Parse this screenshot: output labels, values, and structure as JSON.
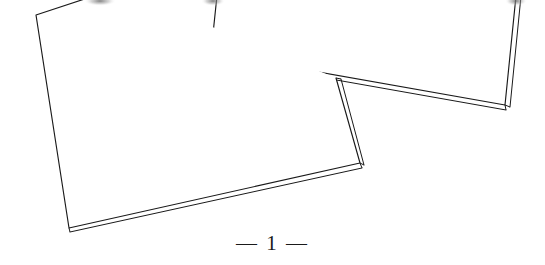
{
  "document": {
    "type": "scanned-page-photograph",
    "background_color": "#ffffff",
    "ink_color": "#1a1a1a",
    "width": 545,
    "height": 265
  },
  "folio": {
    "label": "— 1 —",
    "page_number": "1",
    "left_rule": "—",
    "right_rule": "—",
    "center_x": 303,
    "baseline_y": 248,
    "font_size_px": 21
  },
  "objects": [
    {
      "name": "left-sheet",
      "description": "large quadrilateral sheet of paper, tilted, lower-left of frame, drawn with a doubled edge showing paper thickness along the bottom and right sides",
      "stroke_color": "#1a1a1a",
      "stroke_width": 1.1,
      "fill": "#ffffff",
      "outline": [
        [
          36,
          15
        ],
        [
          118,
          -12
        ],
        [
          336,
          78
        ],
        [
          360,
          163
        ],
        [
          69,
          228
        ]
      ],
      "thickness_edges": [
        {
          "from": [
            69,
            228
          ],
          "to": [
            360,
            163
          ],
          "offset": [
            1,
            4
          ]
        },
        {
          "from": [
            336,
            78
          ],
          "to": [
            360,
            163
          ],
          "offset": [
            4,
            0
          ]
        }
      ]
    },
    {
      "name": "right-sheet",
      "description": "second sheet of paper overlapping above and to the right, clipped by the top edge of the frame, doubled edges along bottom and right",
      "stroke_color": "#1a1a1a",
      "stroke_width": 1.1,
      "fill": "#ffffff",
      "outline": [
        [
          218,
          -14
        ],
        [
          211,
          53
        ],
        [
          505,
          105
        ],
        [
          517,
          -14
        ]
      ],
      "thickness_edges": [
        {
          "from": [
            211,
            53
          ],
          "to": [
            505,
            105
          ],
          "offset": [
            0,
            5
          ]
        },
        {
          "from": [
            505,
            105
          ],
          "to": [
            517,
            -14
          ],
          "offset": [
            5,
            0
          ]
        }
      ]
    }
  ],
  "marks": {
    "smudge_top_left": {
      "x": 100,
      "y": 2,
      "description": "faint grey smudge along top edge"
    },
    "smudge_top_mid": {
      "x": 212,
      "y": 2,
      "description": "faint grey smudge along top edge"
    },
    "smudge_top_right": {
      "x": 516,
      "y": 2,
      "description": "faint grey smudge along top edge"
    }
  }
}
